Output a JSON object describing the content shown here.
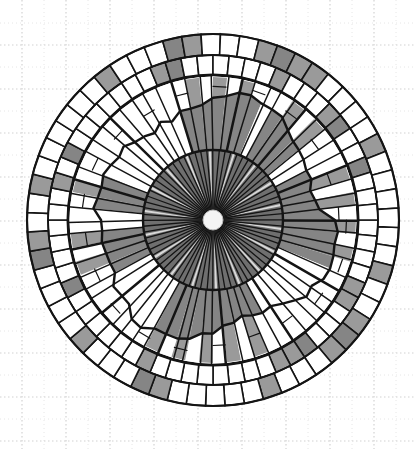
{
  "drawing": {
    "description": "Hand-drawn circular radial mandala on dotted grid paper",
    "canvas": {
      "width": 416,
      "height": 449,
      "background": "#ffffff"
    },
    "grid": {
      "major_spacing": 44,
      "offset_x": 22,
      "offset_y": 45,
      "minor": true,
      "color": "#d2d2d2"
    },
    "center": {
      "x": 213,
      "y": 220
    },
    "colors": {
      "ink": "#141414",
      "paper": "#ffffff",
      "shade_light": "#9a9a9a",
      "shade_mid": "#858585",
      "shade_dark": "#6f6f6f",
      "hub": "#f4f4f4"
    },
    "hub": {
      "radius": 10
    },
    "inner_disk": {
      "radius": 70,
      "spokes": 72,
      "fill": "shade_dark"
    },
    "middle_band": {
      "inner_radius": 70,
      "outer_radius_min": 100,
      "outer_radius_max": 132,
      "spokes": 64,
      "jagged": true,
      "shaded_sectors": [
        {
          "from_deg": 255,
          "to_deg": 292
        },
        {
          "from_deg": 300,
          "to_deg": 318
        },
        {
          "from_deg": 330,
          "to_deg": 20
        },
        {
          "from_deg": 60,
          "to_deg": 118
        },
        {
          "from_deg": 150,
          "to_deg": 172
        },
        {
          "from_deg": 185,
          "to_deg": 200
        }
      ]
    },
    "bold_ring": {
      "radius": 145,
      "stroke": 3
    },
    "outer_rings": [
      {
        "inner_radius": 145,
        "outer_radius": 165,
        "cells": 64,
        "shaded_cells": [
          4,
          5,
          9,
          10,
          11,
          20,
          27,
          34,
          36,
          44,
          45,
          52,
          56,
          57,
          60
        ]
      },
      {
        "inner_radius": 165,
        "outer_radius": 186,
        "cells": 60,
        "shaded_cells": [
          2,
          5,
          6,
          7,
          11,
          17,
          18,
          22,
          27,
          28,
          31,
          38,
          42,
          43,
          47,
          48,
          49,
          50,
          55
        ]
      }
    ]
  }
}
